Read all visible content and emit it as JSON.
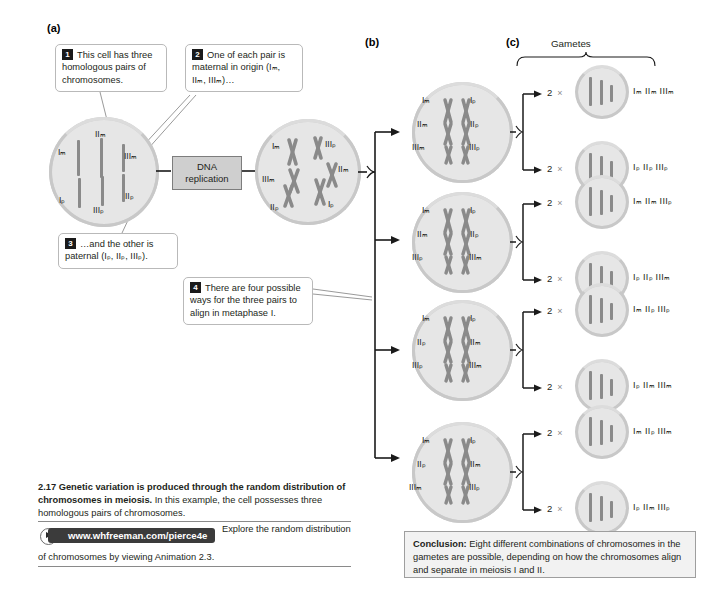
{
  "figure": {
    "panel_a_letter": "(a)",
    "panel_b_letter": "(b)",
    "panel_c_letter": "(c)",
    "gametes_header": "Gametes",
    "dna_replication_label": "DNA\nreplication"
  },
  "callouts": [
    {
      "num": "1",
      "text": "This cell has three homologous pairs of chromosomes."
    },
    {
      "num": "2",
      "text": "One of each pair is maternal in origin (Iₘ, IIₘ, IIIₘ)…"
    },
    {
      "num": "3",
      "text": "…and the other is paternal (Iₚ, IIₚ, IIIₚ)."
    },
    {
      "num": "4",
      "text": "There are four possible ways for the three pairs to align in metaphase I."
    }
  ],
  "cell_a1": {
    "name": "diploid-cell-before-replication",
    "chromosomes": [
      "Iₘ",
      "IIₘ",
      "IIIₘ",
      "Iₚ",
      "IIₚ",
      "IIIₚ"
    ]
  },
  "cell_a2": {
    "name": "diploid-cell-after-replication",
    "chromosomes": [
      "Iₘ",
      "IIIₚ",
      "IIIₘ",
      "IIₘ",
      "IIₚ",
      "Iₚ"
    ]
  },
  "metaphase_cells": [
    {
      "id": "metaphase-cell-1",
      "left": [
        "Iₘ",
        "IIₘ",
        "IIIₘ"
      ],
      "right": [
        "Iₚ",
        "IIₚ",
        "IIIₚ"
      ]
    },
    {
      "id": "metaphase-cell-2",
      "left": [
        "Iₘ",
        "IIₘ",
        "IIIₚ"
      ],
      "right": [
        "Iₚ",
        "IIₚ",
        "IIIₘ"
      ]
    },
    {
      "id": "metaphase-cell-3",
      "left": [
        "Iₘ",
        "IIₚ",
        "IIIₚ"
      ],
      "right": [
        "Iₚ",
        "IIₘ",
        "IIIₘ"
      ]
    },
    {
      "id": "metaphase-cell-4",
      "left": [
        "Iₘ",
        "IIₚ",
        "IIIₘ"
      ],
      "right": [
        "Iₚ",
        "IIₘ",
        "IIIₚ"
      ]
    }
  ],
  "gametes": [
    {
      "count": "2",
      "times": "×",
      "label": "Iₘ IIₘ IIIₘ"
    },
    {
      "count": "2",
      "times": "×",
      "label": "Iₚ IIₚ IIIₚ"
    },
    {
      "count": "2",
      "times": "×",
      "label": "Iₘ IIₘ IIIₚ"
    },
    {
      "count": "2",
      "times": "×",
      "label": "Iₚ IIₚ IIIₘ"
    },
    {
      "count": "2",
      "times": "×",
      "label": "Iₘ IIₚ IIIₚ"
    },
    {
      "count": "2",
      "times": "×",
      "label": "Iₚ IIₘ IIIₘ"
    },
    {
      "count": "2",
      "times": "×",
      "label": "Iₘ IIₚ IIIₘ"
    },
    {
      "count": "2",
      "times": "×",
      "label": "Iₚ IIₘ IIIₚ"
    }
  ],
  "caption": {
    "number": "2.17",
    "title": "Genetic variation is produced through the random distribution of chromosomes in meiosis.",
    "body": "In this example, the cell possesses three homologous pairs of chromosomes."
  },
  "animation": {
    "url": "www.whfreeman.com/pierce4e",
    "text_part1": "Explore the random distribution",
    "text_part2": "of chromosomes by viewing Animation 2.3."
  },
  "conclusion": {
    "label": "Conclusion:",
    "text": " Eight different combinations of chromosomes in the gametes are possible, depending on how the chromosomes align and separate in meiosis I and II."
  },
  "colors": {
    "cell_fill": "#e6e6e6",
    "cell_ring": "#c8c8c8",
    "chromosome": "#8a8a8a",
    "callout_border": "#b9b9b9",
    "dna_box_fill": "#cfcfcf",
    "url_bar": "#3b3b3b"
  }
}
